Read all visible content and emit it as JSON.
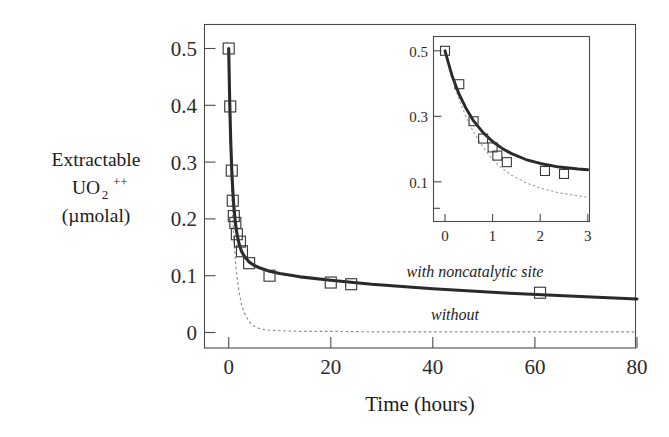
{
  "figure": {
    "background_color": "#ffffff",
    "line_color": "#2a2a2a",
    "dashed_color": "#8d8d8d",
    "marker_color": "#3a3a3a"
  },
  "axes": {
    "ylabel_line1": "Extractable",
    "ylabel_line2_base": "UO",
    "ylabel_line2_sub": "2",
    "ylabel_line2_sup": "++",
    "ylabel_line3": "(µmolal)",
    "xlabel": "Time (hours)",
    "ytick_labels": [
      "0.5",
      "0.4",
      "0.3",
      "0.2",
      "0.1",
      "0"
    ],
    "ytick_values": [
      0.5,
      0.4,
      0.3,
      0.2,
      0.1,
      0
    ],
    "xtick_labels": [
      "0",
      "20",
      "40",
      "60",
      "80"
    ],
    "xtick_values": [
      0,
      20,
      40,
      60,
      80
    ],
    "xlim": [
      -3,
      80
    ],
    "ylim": [
      -0.035,
      0.555
    ]
  },
  "annotations": {
    "with_site": "with noncatalytic site",
    "without_site": "without"
  },
  "inset": {
    "ytick_labels": [
      "0.5",
      "0.3",
      "0.1"
    ],
    "ytick_values": [
      0.5,
      0.3,
      0.1
    ],
    "xtick_labels": [
      "0",
      "1",
      "2",
      "3"
    ],
    "xtick_values": [
      0,
      1,
      2,
      3
    ],
    "xlim": [
      -0.25,
      3.05
    ],
    "ylim": [
      -0.02,
      0.565
    ]
  },
  "chart_data": {
    "type": "scatter",
    "title": "",
    "xlabel": "Time (hours)",
    "ylabel": "Extractable UO2++ (µmolal)",
    "xlim": [
      -3,
      80
    ],
    "ylim": [
      -0.035,
      0.555
    ],
    "xticks": [
      0,
      20,
      40,
      60,
      80
    ],
    "yticks": [
      0,
      0.1,
      0.2,
      0.3,
      0.4,
      0.5
    ],
    "grid": false,
    "legend_position": "inline-annotations",
    "series": [
      {
        "name": "measured data",
        "type": "scatter",
        "marker": "open-square",
        "x": [
          0.0,
          0.3,
          0.6,
          0.8,
          1.0,
          1.3,
          1.6,
          2.2,
          2.6,
          4.0,
          8.0,
          20.0,
          24.0,
          61.0
        ],
        "y": [
          0.5,
          0.398,
          0.285,
          0.232,
          0.205,
          0.193,
          0.173,
          0.16,
          0.143,
          0.122,
          0.1,
          0.088,
          0.085,
          0.07
        ]
      },
      {
        "name": "with noncatalytic site",
        "type": "line",
        "style": "solid",
        "x": [
          0.0,
          0.2,
          0.4,
          0.6,
          0.8,
          1.0,
          1.3,
          1.6,
          2.0,
          2.5,
          3.0,
          4.0,
          5.0,
          6.0,
          8.0,
          10.0,
          14.0,
          20.0,
          28.0,
          40.0,
          55.0,
          70.0,
          80.0
        ],
        "y": [
          0.5,
          0.405,
          0.336,
          0.286,
          0.25,
          0.223,
          0.194,
          0.175,
          0.157,
          0.143,
          0.135,
          0.124,
          0.118,
          0.114,
          0.108,
          0.104,
          0.098,
          0.092,
          0.085,
          0.077,
          0.069,
          0.063,
          0.059
        ]
      },
      {
        "name": "without",
        "type": "line",
        "style": "dashed",
        "x": [
          0.0,
          0.2,
          0.4,
          0.6,
          0.8,
          1.0,
          1.3,
          1.6,
          2.0,
          2.5,
          3.0,
          4.0,
          5.0,
          6.0,
          7.0,
          8.0,
          10.0,
          14.0,
          20.0,
          30.0,
          45.0,
          60.0,
          80.0
        ],
        "y": [
          0.5,
          0.392,
          0.31,
          0.249,
          0.203,
          0.167,
          0.128,
          0.1,
          0.073,
          0.05,
          0.036,
          0.019,
          0.011,
          0.007,
          0.005,
          0.004,
          0.003,
          0.002,
          0.002,
          0.001,
          0.001,
          0.001,
          0.001
        ]
      }
    ],
    "inset": {
      "type": "scatter",
      "xlim": [
        -0.25,
        3.05
      ],
      "ylim": [
        -0.02,
        0.565
      ],
      "xticks": [
        0,
        1,
        2,
        3
      ],
      "yticks": [
        0.1,
        0.3,
        0.5
      ],
      "series": [
        {
          "name": "measured data",
          "type": "scatter",
          "marker": "open-square",
          "x": [
            0.0,
            0.3,
            0.6,
            0.8,
            1.0,
            1.1,
            1.3,
            2.1,
            2.5
          ],
          "y": [
            0.5,
            0.398,
            0.285,
            0.232,
            0.205,
            0.18,
            0.16,
            0.133,
            0.124
          ]
        },
        {
          "name": "with noncatalytic site",
          "type": "line",
          "style": "solid",
          "x": [
            0.0,
            0.15,
            0.3,
            0.45,
            0.6,
            0.8,
            1.0,
            1.2,
            1.4,
            1.7,
            2.0,
            2.4,
            2.8,
            3.0
          ],
          "y": [
            0.5,
            0.423,
            0.366,
            0.322,
            0.286,
            0.25,
            0.223,
            0.202,
            0.186,
            0.168,
            0.156,
            0.145,
            0.139,
            0.137
          ]
        },
        {
          "name": "without",
          "type": "line",
          "style": "dashed",
          "x": [
            0.0,
            0.15,
            0.3,
            0.45,
            0.6,
            0.8,
            1.0,
            1.2,
            1.4,
            1.7,
            2.0,
            2.4,
            2.8,
            3.0
          ],
          "y": [
            0.5,
            0.415,
            0.348,
            0.296,
            0.252,
            0.205,
            0.169,
            0.141,
            0.12,
            0.097,
            0.081,
            0.066,
            0.057,
            0.053
          ]
        }
      ]
    }
  }
}
